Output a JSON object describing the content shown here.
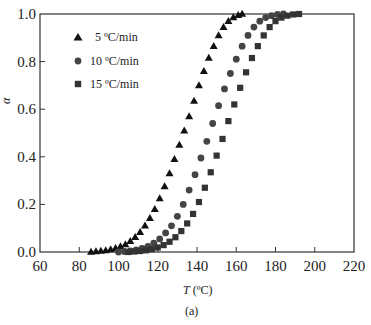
{
  "chart_data": {
    "type": "scatter",
    "title": "",
    "xlabel": "T (ºC)",
    "ylabel": "α",
    "caption": "(a)",
    "xlim": [
      60,
      220
    ],
    "ylim": [
      0.0,
      1.0
    ],
    "xticks": [
      60,
      80,
      100,
      120,
      140,
      160,
      180,
      200,
      220
    ],
    "yticks": [
      0.0,
      0.2,
      0.4,
      0.6,
      0.8,
      1.0
    ],
    "xtick_labels": [
      "60",
      "80",
      "100",
      "120",
      "140",
      "160",
      "180",
      "200",
      "220"
    ],
    "ytick_labels": [
      "0.0",
      "0.2",
      "0.4",
      "0.6",
      "0.8",
      "1.0"
    ],
    "grid": false,
    "legend_position": "upper left",
    "series": [
      {
        "name": "5 ºC/min",
        "marker": "triangle",
        "color": "#111111",
        "x": [
          86,
          88.5,
          91,
          93.5,
          96,
          98.5,
          101,
          103.5,
          106,
          108.5,
          111,
          113.5,
          116,
          118.5,
          121,
          123.5,
          126,
          128.5,
          131,
          133.5,
          136,
          138.5,
          141,
          143.5,
          146,
          148.5,
          151,
          153.5,
          156,
          158.5,
          161,
          163
        ],
        "y": [
          0.0,
          0.002,
          0.004,
          0.007,
          0.011,
          0.016,
          0.023,
          0.032,
          0.045,
          0.062,
          0.083,
          0.11,
          0.142,
          0.18,
          0.225,
          0.275,
          0.33,
          0.39,
          0.45,
          0.51,
          0.57,
          0.635,
          0.7,
          0.76,
          0.815,
          0.865,
          0.91,
          0.945,
          0.97,
          0.985,
          0.995,
          1.0
        ]
      },
      {
        "name": "10 ºC/min",
        "marker": "circle",
        "color": "#444444",
        "x": [
          100,
          103,
          106,
          109,
          112,
          115,
          118,
          121,
          124,
          127,
          130,
          133,
          136,
          139,
          142,
          145,
          148,
          151,
          154,
          157,
          160,
          163,
          166,
          169,
          172,
          175,
          178,
          181,
          184
        ],
        "y": [
          0.0,
          0.002,
          0.005,
          0.009,
          0.015,
          0.024,
          0.037,
          0.055,
          0.08,
          0.11,
          0.15,
          0.2,
          0.26,
          0.325,
          0.395,
          0.465,
          0.54,
          0.615,
          0.685,
          0.75,
          0.81,
          0.865,
          0.91,
          0.945,
          0.97,
          0.985,
          0.993,
          0.998,
          1.0
        ]
      },
      {
        "name": "15 ºC/min",
        "marker": "square",
        "color": "#333333",
        "x": [
          105,
          108,
          111,
          114,
          117,
          120,
          123,
          126,
          129,
          132,
          135,
          138,
          141,
          144,
          147,
          150,
          153,
          156,
          159,
          162,
          165,
          168,
          171,
          174,
          177,
          180,
          183,
          186,
          189,
          192
        ],
        "y": [
          0.0,
          0.002,
          0.004,
          0.007,
          0.012,
          0.019,
          0.029,
          0.043,
          0.062,
          0.088,
          0.12,
          0.16,
          0.21,
          0.27,
          0.335,
          0.405,
          0.475,
          0.55,
          0.62,
          0.69,
          0.755,
          0.815,
          0.865,
          0.91,
          0.945,
          0.97,
          0.985,
          0.993,
          0.998,
          1.0
        ]
      }
    ]
  },
  "legend": {
    "items": [
      {
        "label": "5 ºC/min",
        "marker": "triangle"
      },
      {
        "label": "10 ºC/min",
        "marker": "circle"
      },
      {
        "label": "15 ºC/min",
        "marker": "square"
      }
    ]
  },
  "axes": {
    "x_label_italic": "T",
    "x_label_unit": " (ºC)",
    "y_label": "α"
  },
  "figure": {
    "caption": "(a)"
  }
}
